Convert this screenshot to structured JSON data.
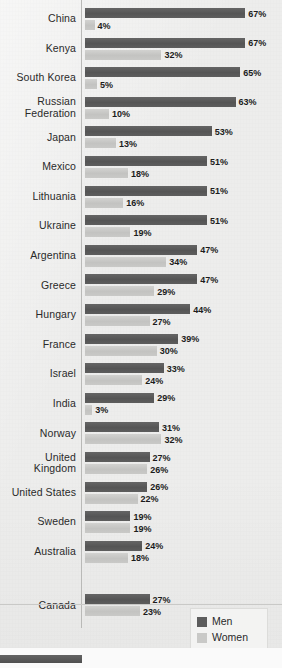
{
  "chart_data": {
    "type": "bar",
    "orientation": "horizontal",
    "title": "",
    "subtitle": "",
    "xlabel": "",
    "ylabel": "",
    "xlim": [
      0,
      70
    ],
    "grid": false,
    "legend_position": "bottom-right",
    "value_suffix": "%",
    "categories": [
      "China",
      "Kenya",
      "South Korea",
      "Russian Federation",
      "Japan",
      "Mexico",
      "Lithuania",
      "Ukraine",
      "Argentina",
      "Greece",
      "Hungary",
      "France",
      "Israel",
      "India",
      "Norway",
      "United Kingdom",
      "United States",
      "Sweden",
      "Australia",
      "Canada"
    ],
    "series": [
      {
        "name": "Men",
        "color": "#5d5d5d",
        "values": [
          67,
          67,
          65,
          63,
          53,
          51,
          51,
          51,
          47,
          47,
          44,
          39,
          33,
          29,
          31,
          27,
          26,
          19,
          24,
          27
        ]
      },
      {
        "name": "Women",
        "color": "#c9c9c7",
        "values": [
          4,
          32,
          5,
          10,
          13,
          18,
          16,
          19,
          34,
          29,
          27,
          30,
          24,
          3,
          32,
          26,
          22,
          19,
          18,
          23
        ]
      }
    ]
  },
  "legend": {
    "items": [
      {
        "label": "Men",
        "swatch": "men"
      },
      {
        "label": "Women",
        "swatch": "women"
      }
    ]
  },
  "labels": {
    "rows": [
      {
        "lines": [
          "China"
        ]
      },
      {
        "lines": [
          "Kenya"
        ]
      },
      {
        "lines": [
          "South Korea"
        ]
      },
      {
        "lines": [
          "Russian",
          "Federation"
        ]
      },
      {
        "lines": [
          "Japan"
        ]
      },
      {
        "lines": [
          "Mexico"
        ]
      },
      {
        "lines": [
          "Lithuania"
        ]
      },
      {
        "lines": [
          "Ukraine"
        ]
      },
      {
        "lines": [
          "Argentina"
        ]
      },
      {
        "lines": [
          "Greece"
        ]
      },
      {
        "lines": [
          "Hungary"
        ]
      },
      {
        "lines": [
          "France"
        ]
      },
      {
        "lines": [
          "Israel"
        ]
      },
      {
        "lines": [
          "India"
        ]
      },
      {
        "lines": [
          "Norway"
        ]
      },
      {
        "lines": [
          "United",
          "Kingdom"
        ]
      },
      {
        "lines": [
          "United States"
        ]
      },
      {
        "lines": [
          "Sweden"
        ]
      },
      {
        "lines": [
          "Australia"
        ]
      },
      {
        "lines": [
          "Canada"
        ]
      }
    ]
  },
  "style": {
    "men_color": "#5d5d5d",
    "women_color": "#c9c9c7",
    "axis_color": "#b9b9b7",
    "text_color": "#2a2a2a",
    "background": "#ededec"
  }
}
